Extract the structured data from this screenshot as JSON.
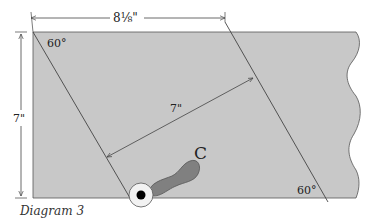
{
  "diagram": {
    "caption": "Diagram 3",
    "labels": {
      "width_dim": "8⅛\"",
      "height_dim": "7\"",
      "perp_dim": "7\"",
      "angle_top": "60°",
      "angle_bottom": "60°",
      "tool_label": "C"
    },
    "colors": {
      "board_fill": "#c8c8c8",
      "line": "#444444",
      "tool_fill": "#808080",
      "background": "#ffffff"
    }
  }
}
